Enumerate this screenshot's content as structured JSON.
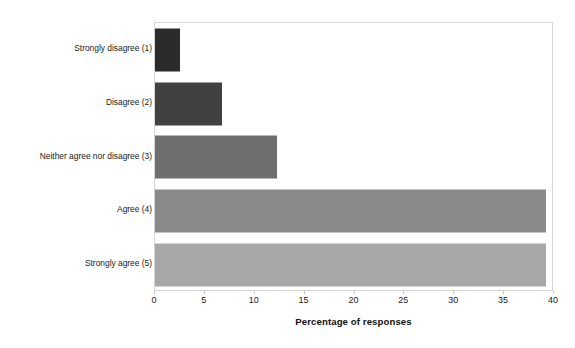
{
  "chart_data": {
    "type": "bar",
    "orientation": "horizontal",
    "title": "",
    "xlabel": "Percentage of responses",
    "ylabel": "",
    "categories": [
      "Strongly disagree (1)",
      "Disagree (2)",
      "Neither agree nor disagree (3)",
      "Agree (4)",
      "Strongly agree (5)"
    ],
    "values": [
      2.5,
      6.7,
      12.2,
      39.2,
      39.2
    ],
    "xlim": [
      0,
      40
    ],
    "xticks": [
      0,
      5,
      10,
      15,
      20,
      25,
      30,
      35,
      40
    ],
    "xtick_labels": [
      "0",
      "5",
      "10",
      "15",
      "20",
      "25",
      "30",
      "35",
      "40"
    ],
    "grid": false,
    "legend": null,
    "bar_colors": [
      "#2b2b2b",
      "#414141",
      "#6e6e6e",
      "#8a8a8a",
      "#a8a8a8"
    ],
    "plot_border_color": "#d6d6d6"
  }
}
